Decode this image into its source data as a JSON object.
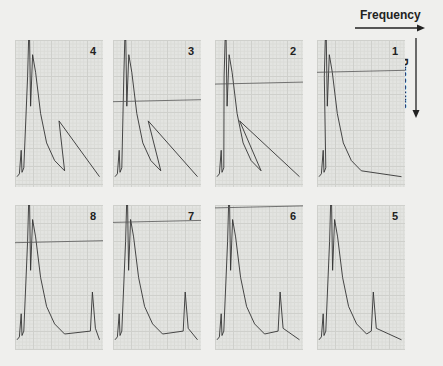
{
  "axes": {
    "horizontal": "Frequency",
    "vertical": "Pressure"
  },
  "chart_data": {
    "type": "line",
    "title": "",
    "xlabel": "Frequency",
    "ylabel": "Pressure",
    "grid": true,
    "layout": "2 rows x 4 panels, numbered right-to-left: top row 4,3,2,1; bottom row 8,7,6,5",
    "panels": [
      {
        "id": 1,
        "row": 0,
        "col": 3,
        "label": "1",
        "pressure_line_y": 0.22,
        "main_peak_x": 0.14,
        "secondary_peak_x": null
      },
      {
        "id": 2,
        "row": 0,
        "col": 2,
        "label": "2",
        "pressure_line_y": 0.3,
        "main_peak_x": 0.16,
        "secondary_peak_x": 0.28
      },
      {
        "id": 3,
        "row": 0,
        "col": 1,
        "label": "3",
        "pressure_line_y": 0.42,
        "main_peak_x": 0.18,
        "secondary_peak_x": 0.4
      },
      {
        "id": 4,
        "row": 0,
        "col": 0,
        "label": "4",
        "pressure_line_y": null,
        "main_peak_x": 0.2,
        "secondary_peak_x": 0.5
      },
      {
        "id": 5,
        "row": 1,
        "col": 3,
        "label": "5",
        "pressure_line_y": null,
        "main_peak_x": 0.2,
        "secondary_peak_x": 0.64
      },
      {
        "id": 6,
        "row": 1,
        "col": 2,
        "label": "6",
        "pressure_line_y": 0.02,
        "main_peak_x": 0.2,
        "secondary_peak_x": 0.74
      },
      {
        "id": 7,
        "row": 1,
        "col": 1,
        "label": "7",
        "pressure_line_y": 0.12,
        "main_peak_x": 0.2,
        "secondary_peak_x": 0.82
      },
      {
        "id": 8,
        "row": 1,
        "col": 0,
        "label": "8",
        "pressure_line_y": 0.26,
        "main_peak_x": 0.2,
        "secondary_peak_x": 0.88
      }
    ]
  }
}
